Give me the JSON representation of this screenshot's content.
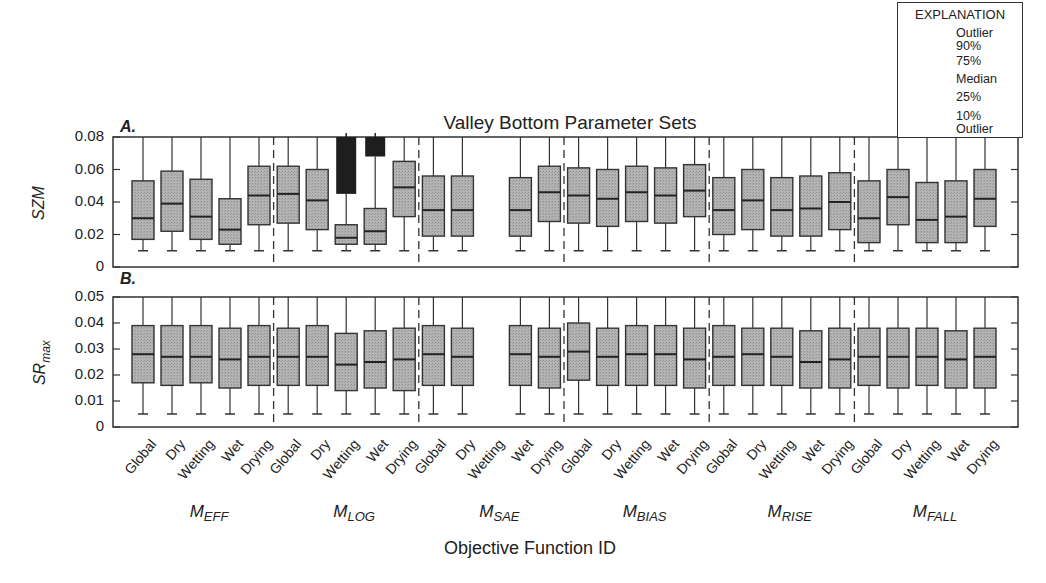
{
  "title": "Valley Bottom Parameter Sets",
  "xlabel": "Objective Function ID",
  "legend": {
    "title": "EXPLANATION",
    "items": [
      "Outlier",
      "90%",
      "75%",
      "Median",
      "25%",
      "10%",
      "Outlier"
    ]
  },
  "groups": [
    {
      "main": "M",
      "sub": "EFF"
    },
    {
      "main": "M",
      "sub": "LOG"
    },
    {
      "main": "M",
      "sub": "SAE"
    },
    {
      "main": "M",
      "sub": "BIAS"
    },
    {
      "main": "M",
      "sub": "RISE"
    },
    {
      "main": "M",
      "sub": "FALL"
    }
  ],
  "subsets": [
    "Global",
    "Dry",
    "Wetting",
    "Wet",
    "Drying"
  ],
  "panels": [
    {
      "label": "A.",
      "ylabel": "SZM",
      "ticks": [
        "0.08",
        "0.06",
        "0.04",
        "0.02",
        "0"
      ]
    },
    {
      "label": "B.",
      "ylabel": "SR",
      "ylabel_sub": "max",
      "ticks": [
        "0.05",
        "0.04",
        "0.03",
        "0.02",
        "0.01",
        "0"
      ]
    }
  ],
  "chart_data": [
    {
      "type": "box",
      "title": "Valley Bottom Parameter Sets",
      "panel": "A.",
      "ylabel": "SZM",
      "xlabel": "Objective Function ID",
      "ylim": [
        0,
        0.08
      ],
      "yticks": [
        0,
        0.02,
        0.04,
        0.06,
        0.08
      ],
      "groups": [
        "M_EFF",
        "M_LOG",
        "M_SAE",
        "M_BIAS",
        "M_RISE",
        "M_FALL"
      ],
      "categories": [
        "Global",
        "Dry",
        "Wetting",
        "Wet",
        "Drying"
      ],
      "stats_order": [
        "p10",
        "p25",
        "median",
        "p75",
        "p90"
      ],
      "series": [
        {
          "name": "M_EFF",
          "boxes": [
            [
              0.01,
              0.017,
              0.03,
              0.053,
              0.08
            ],
            [
              0.01,
              0.022,
              0.039,
              0.059,
              0.08
            ],
            [
              0.01,
              0.017,
              0.031,
              0.054,
              0.08
            ],
            [
              0.01,
              0.014,
              0.023,
              0.042,
              0.08
            ],
            [
              0.01,
              0.026,
              0.044,
              0.062,
              0.08
            ]
          ]
        },
        {
          "name": "M_LOG",
          "boxes": [
            [
              0.01,
              0.027,
              0.045,
              0.062,
              0.08
            ],
            [
              0.01,
              0.023,
              0.041,
              0.06,
              0.08
            ],
            [
              0.01,
              0.014,
              0.018,
              0.026,
              0.045
            ],
            [
              0.01,
              0.014,
              0.022,
              0.036,
              0.068
            ],
            [
              0.01,
              0.031,
              0.049,
              0.065,
              0.08
            ]
          ],
          "outliers": [
            {
              "category": "Wetting",
              "range": [
                0.045,
                0.08
              ]
            },
            {
              "category": "Wet",
              "range": [
                0.068,
                0.08
              ]
            }
          ]
        },
        {
          "name": "M_SAE",
          "boxes": [
            [
              0.01,
              0.019,
              0.035,
              0.056,
              0.08
            ],
            [
              0.01,
              0.019,
              0.035,
              0.056,
              0.08
            ],
            null,
            [
              0.01,
              0.019,
              0.035,
              0.055,
              0.08
            ],
            [
              0.01,
              0.028,
              0.046,
              0.062,
              0.08
            ]
          ]
        },
        {
          "name": "M_BIAS",
          "boxes": [
            [
              0.01,
              0.027,
              0.044,
              0.061,
              0.08
            ],
            [
              0.01,
              0.025,
              0.042,
              0.06,
              0.08
            ],
            [
              0.01,
              0.028,
              0.046,
              0.062,
              0.08
            ],
            [
              0.01,
              0.027,
              0.044,
              0.061,
              0.08
            ],
            [
              0.01,
              0.031,
              0.047,
              0.063,
              0.08
            ]
          ]
        },
        {
          "name": "M_RISE",
          "boxes": [
            [
              0.01,
              0.02,
              0.035,
              0.055,
              0.08
            ],
            [
              0.01,
              0.023,
              0.041,
              0.06,
              0.08
            ],
            [
              0.01,
              0.019,
              0.035,
              0.055,
              0.08
            ],
            [
              0.01,
              0.019,
              0.036,
              0.056,
              0.08
            ],
            [
              0.01,
              0.023,
              0.04,
              0.058,
              0.08
            ]
          ]
        },
        {
          "name": "M_FALL",
          "boxes": [
            [
              0.01,
              0.015,
              0.03,
              0.053,
              0.08
            ],
            [
              0.01,
              0.026,
              0.043,
              0.06,
              0.08
            ],
            [
              0.01,
              0.015,
              0.029,
              0.052,
              0.08
            ],
            [
              0.01,
              0.015,
              0.031,
              0.053,
              0.08
            ],
            [
              0.01,
              0.025,
              0.042,
              0.06,
              0.08
            ]
          ]
        }
      ]
    },
    {
      "type": "box",
      "panel": "B.",
      "ylabel": "SR_max",
      "xlabel": "Objective Function ID",
      "ylim": [
        0,
        0.05
      ],
      "yticks": [
        0,
        0.01,
        0.02,
        0.03,
        0.04,
        0.05
      ],
      "groups": [
        "M_EFF",
        "M_LOG",
        "M_SAE",
        "M_BIAS",
        "M_RISE",
        "M_FALL"
      ],
      "categories": [
        "Global",
        "Dry",
        "Wetting",
        "Wet",
        "Drying"
      ],
      "stats_order": [
        "p10",
        "p25",
        "median",
        "p75",
        "p90"
      ],
      "series": [
        {
          "name": "M_EFF",
          "boxes": [
            [
              0.005,
              0.017,
              0.028,
              0.039,
              0.05
            ],
            [
              0.005,
              0.016,
              0.027,
              0.039,
              0.05
            ],
            [
              0.005,
              0.017,
              0.027,
              0.039,
              0.05
            ],
            [
              0.005,
              0.015,
              0.026,
              0.038,
              0.05
            ],
            [
              0.005,
              0.016,
              0.027,
              0.039,
              0.05
            ]
          ]
        },
        {
          "name": "M_LOG",
          "boxes": [
            [
              0.005,
              0.016,
              0.027,
              0.038,
              0.05
            ],
            [
              0.005,
              0.016,
              0.027,
              0.039,
              0.05
            ],
            [
              0.005,
              0.014,
              0.024,
              0.036,
              0.05
            ],
            [
              0.005,
              0.015,
              0.025,
              0.037,
              0.05
            ],
            [
              0.005,
              0.014,
              0.026,
              0.038,
              0.05
            ]
          ]
        },
        {
          "name": "M_SAE",
          "boxes": [
            [
              0.005,
              0.016,
              0.028,
              0.039,
              0.05
            ],
            [
              0.005,
              0.016,
              0.027,
              0.038,
              0.05
            ],
            null,
            [
              0.005,
              0.016,
              0.028,
              0.039,
              0.05
            ],
            [
              0.005,
              0.015,
              0.027,
              0.038,
              0.05
            ]
          ]
        },
        {
          "name": "M_BIAS",
          "boxes": [
            [
              0.005,
              0.018,
              0.029,
              0.04,
              0.05
            ],
            [
              0.005,
              0.016,
              0.027,
              0.038,
              0.05
            ],
            [
              0.005,
              0.016,
              0.028,
              0.039,
              0.05
            ],
            [
              0.005,
              0.016,
              0.028,
              0.039,
              0.05
            ],
            [
              0.005,
              0.015,
              0.026,
              0.038,
              0.05
            ]
          ]
        },
        {
          "name": "M_RISE",
          "boxes": [
            [
              0.005,
              0.016,
              0.027,
              0.039,
              0.05
            ],
            [
              0.005,
              0.016,
              0.028,
              0.038,
              0.05
            ],
            [
              0.005,
              0.016,
              0.027,
              0.038,
              0.05
            ],
            [
              0.005,
              0.015,
              0.025,
              0.037,
              0.05
            ],
            [
              0.005,
              0.015,
              0.026,
              0.038,
              0.05
            ]
          ]
        },
        {
          "name": "M_FALL",
          "boxes": [
            [
              0.005,
              0.016,
              0.027,
              0.038,
              0.05
            ],
            [
              0.005,
              0.015,
              0.027,
              0.038,
              0.05
            ],
            [
              0.005,
              0.016,
              0.027,
              0.038,
              0.05
            ],
            [
              0.005,
              0.015,
              0.026,
              0.037,
              0.05
            ],
            [
              0.005,
              0.015,
              0.027,
              0.038,
              0.05
            ]
          ]
        }
      ]
    }
  ]
}
